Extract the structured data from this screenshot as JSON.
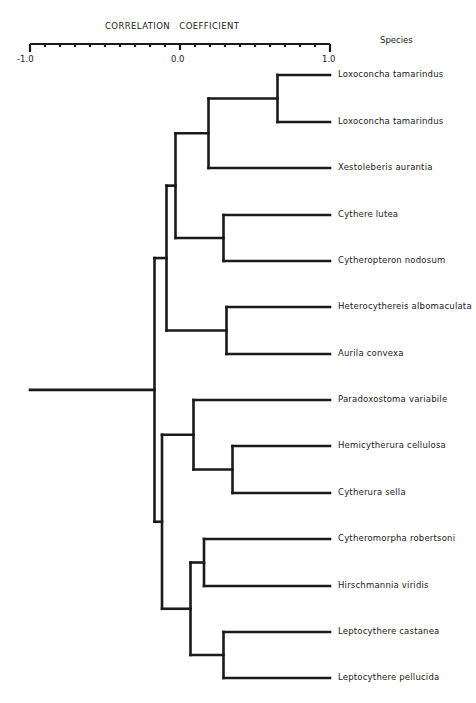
{
  "chart_data": {
    "type": "dendrogram",
    "title": "CORRELATION   COEFFICIENT",
    "xlabel": "CORRELATION COEFFICIENT",
    "leaf_header": "Species",
    "axis": {
      "min": -1.0,
      "max": 1.0,
      "tick_step": 0.1,
      "labels": [
        "-1.0",
        "0.0",
        "1.0"
      ]
    },
    "leaves": [
      "Loxoconcha tamarindus",
      "Loxoconcha tamarindus",
      "Xestoleberis aurantia",
      "Cythere lutea",
      "Cytheropteron nodosum",
      "Heterocythereis albomaculata",
      "Aurila convexa",
      "Paradoxostoma variabile",
      "Hemicytherura cellulosa",
      "Cytherura sella",
      "Cytheromorpha robertsoni",
      "Hirschmannia viridis",
      "Leptocythere castanea",
      "Leptocythere pellucida"
    ],
    "merges": [
      {
        "id": "A",
        "children": [
          "Loxoconcha tamarindus (1)",
          "Loxoconcha tamarindus (2)"
        ],
        "r": 0.65
      },
      {
        "id": "B",
        "children": [
          "A",
          "Xestoleberis aurantia"
        ],
        "r": 0.19
      },
      {
        "id": "C",
        "children": [
          "Cythere lutea",
          "Cytheropteron nodosum"
        ],
        "r": 0.29
      },
      {
        "id": "D",
        "children": [
          "B",
          "C"
        ],
        "r": -0.03
      },
      {
        "id": "E",
        "children": [
          "Heterocythereis albomaculata",
          "Aurila convexa"
        ],
        "r": 0.31
      },
      {
        "id": "F",
        "children": [
          "D",
          "E"
        ],
        "r": -0.09
      },
      {
        "id": "G",
        "children": [
          "Hemicytherura cellulosa",
          "Cytherura sella"
        ],
        "r": 0.35
      },
      {
        "id": "H",
        "children": [
          "Paradoxostoma variabile",
          "G"
        ],
        "r": 0.09
      },
      {
        "id": "I",
        "children": [
          "Cytheromorpha robertsoni",
          "Hirschmannia viridis"
        ],
        "r": 0.16
      },
      {
        "id": "J",
        "children": [
          "Leptocythere castanea",
          "Leptocythere pellucida"
        ],
        "r": 0.29
      },
      {
        "id": "K",
        "children": [
          "I",
          "J"
        ],
        "r": 0.07
      },
      {
        "id": "L",
        "children": [
          "H",
          "K"
        ],
        "r": -0.12
      },
      {
        "id": "ROOT",
        "children": [
          "F",
          "L"
        ],
        "r": -0.17
      }
    ]
  },
  "labels": {
    "title": "CORRELATION   COEFFICIENT",
    "species_header": "Species",
    "tick_neg1": "-1.0",
    "tick_0": "0.0",
    "tick_1": "1.0"
  },
  "leaf_positions_y": [
    75,
    122,
    168,
    215,
    261,
    307,
    354,
    400,
    446,
    493,
    539,
    586,
    632,
    678
  ]
}
